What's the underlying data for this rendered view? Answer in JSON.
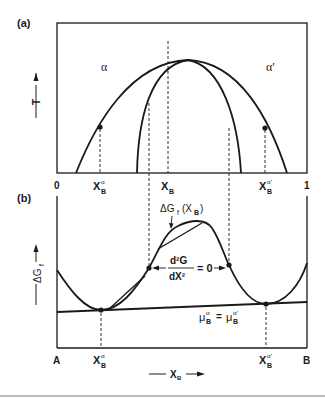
{
  "panel_a": {
    "label": "(a)",
    "y_axis": "T",
    "phase_left": "α",
    "phase_right": "α′",
    "x_ticks": {
      "start": "0",
      "end": "1",
      "x_alpha": "X",
      "x_alpha_sub": "B",
      "x_alpha_sup": "α",
      "x_b": "X",
      "x_b_sub": "B",
      "x_alpha_prime": "X",
      "x_alpha_prime_sub": "B",
      "x_alpha_prime_sup": "α′"
    }
  },
  "panel_b": {
    "label": "(b)",
    "y_axis": "ΔG",
    "y_axis_sub": "f",
    "curve_label": "ΔG",
    "curve_label_sub": "f",
    "curve_label_arg": "(X",
    "curve_label_arg_sub": "B",
    "curve_label_close": ")",
    "spinodal_num": "d²G",
    "spinodal_den": "dX²",
    "spinodal_eq": "= 0",
    "tangent_label_left": "μ",
    "tangent_label_left_sub": "B",
    "tangent_label_left_sup": "α",
    "tangent_eq": "=",
    "tangent_label_right": "μ",
    "tangent_label_right_sub": "B",
    "tangent_label_right_sup": "α′",
    "x_ticks": {
      "start": "A",
      "end": "B",
      "x_alpha": "X",
      "x_alpha_sub": "B",
      "x_alpha_sup": "α",
      "x_alpha_prime": "X",
      "x_alpha_prime_sub": "B",
      "x_alpha_prime_sup": "α′"
    },
    "x_axis": "X",
    "x_axis_sub": "B"
  },
  "colors": {
    "line": "#1a1a1a",
    "background": "#ffffff",
    "rule": "#777777"
  }
}
